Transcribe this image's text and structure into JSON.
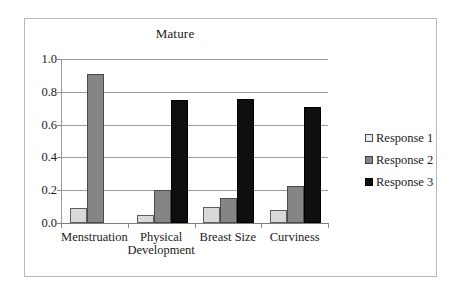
{
  "chart_data": {
    "type": "bar",
    "title": "Mature",
    "xlabel": "",
    "ylabel": "",
    "ylim": [
      0.0,
      1.0
    ],
    "yticks": [
      "0.0",
      "0.2",
      "0.4",
      "0.6",
      "0.8",
      "1.0"
    ],
    "ytick_values": [
      0.0,
      0.2,
      0.4,
      0.6,
      0.8,
      1.0
    ],
    "grid": true,
    "legend_position": "right",
    "categories": [
      "Menstruation",
      "Physical Development",
      "Breast Size",
      "Curviness"
    ],
    "category_lines": [
      [
        "Menstruation"
      ],
      [
        "Physical",
        "Development"
      ],
      [
        "Breast Size"
      ],
      [
        "Curviness"
      ]
    ],
    "series": [
      {
        "name": "Response 1",
        "color": "#d9d9d9",
        "values": [
          0.09,
          0.05,
          0.1,
          0.08
        ]
      },
      {
        "name": "Response 2",
        "color": "#858585",
        "values": [
          0.91,
          0.2,
          0.155,
          0.225
        ]
      },
      {
        "name": "Response 3",
        "color": "#100f0f",
        "values": [
          0.0,
          0.75,
          0.755,
          0.71
        ]
      }
    ]
  },
  "legend": {
    "items": [
      {
        "label": "Response 1"
      },
      {
        "label": "Response 2"
      },
      {
        "label": "Response 3"
      }
    ]
  }
}
